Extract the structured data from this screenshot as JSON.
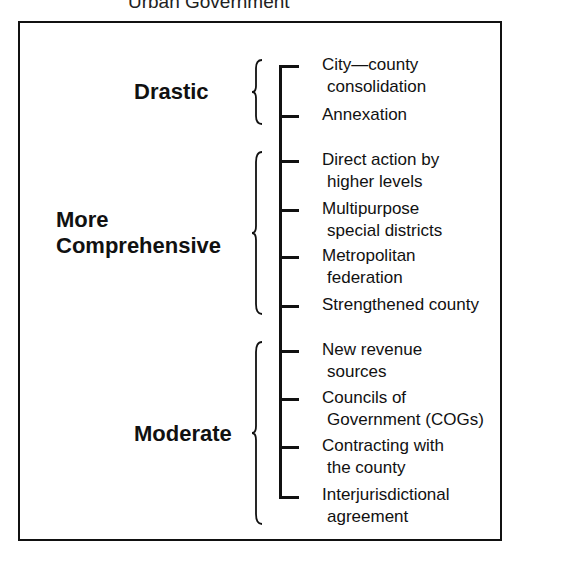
{
  "caption": "Urban Government",
  "categories": [
    {
      "label_lines": [
        "Drastic"
      ]
    },
    {
      "label_lines": [
        "More",
        "Comprehensive"
      ]
    },
    {
      "label_lines": [
        "Moderate"
      ]
    }
  ],
  "items": [
    {
      "line1": "City—county",
      "line2": "consolidation"
    },
    {
      "line1": "Annexation",
      "line2": ""
    },
    {
      "line1": "Direct action by",
      "line2": "higher levels"
    },
    {
      "line1": "Multipurpose",
      "line2": "special districts"
    },
    {
      "line1": "Metropolitan",
      "line2": "federation"
    },
    {
      "line1": "Strengthened county",
      "line2": ""
    },
    {
      "line1": "New revenue",
      "line2": "sources"
    },
    {
      "line1": "Councils of",
      "line2": "Government (COGs)"
    },
    {
      "line1": "Contracting with",
      "line2": "the county"
    },
    {
      "line1": "Interjurisdictional",
      "line2": "agreement"
    }
  ]
}
